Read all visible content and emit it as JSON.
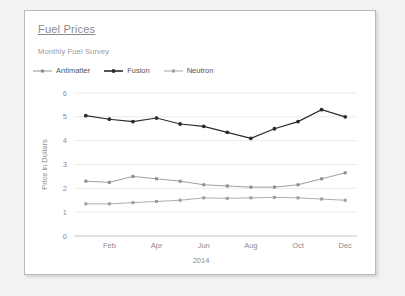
{
  "card": {
    "title": "Fuel Prices",
    "subtitle": "Monthly Fuel Survey"
  },
  "legend": {
    "position": "top-left",
    "items": [
      {
        "label": "Antimatter",
        "color": "#8c8c8c",
        "marker": "square"
      },
      {
        "label": "Fusion",
        "color": "#2b2b2b",
        "marker": "circle"
      },
      {
        "label": "Neutron",
        "color": "#9e9e9e",
        "marker": "square"
      }
    ]
  },
  "chart_data": {
    "type": "line",
    "title": "Fuel Prices",
    "subtitle": "Monthly Fuel Survey",
    "xlabel": "2014",
    "ylabel": "Price in Dollars",
    "ylim": [
      0,
      6
    ],
    "yticks": [
      0,
      1,
      2,
      3,
      4,
      5,
      6
    ],
    "grid": true,
    "categories": [
      "Jan",
      "Feb",
      "Mar",
      "Apr",
      "May",
      "Jun",
      "Jul",
      "Aug",
      "Sep",
      "Oct",
      "Nov",
      "Dec"
    ],
    "xtick_labels": [
      "Feb",
      "Apr",
      "Jun",
      "Aug",
      "Oct",
      "Dec"
    ],
    "xtick_indices": [
      1,
      3,
      5,
      7,
      9,
      11
    ],
    "series": [
      {
        "name": "Fusion",
        "color": "#2b2b2b",
        "values": [
          5.05,
          4.9,
          4.8,
          4.95,
          4.7,
          4.6,
          4.35,
          4.1,
          4.5,
          4.8,
          5.3,
          5.0
        ]
      },
      {
        "name": "Antimatter",
        "color": "#8c8c8c",
        "values": [
          2.3,
          2.25,
          2.5,
          2.4,
          2.3,
          2.15,
          2.1,
          2.05,
          2.05,
          2.15,
          2.4,
          2.65
        ]
      },
      {
        "name": "Neutron",
        "color": "#9e9e9e",
        "values": [
          1.35,
          1.35,
          1.4,
          1.45,
          1.5,
          1.6,
          1.58,
          1.6,
          1.62,
          1.6,
          1.55,
          1.5
        ]
      }
    ]
  }
}
